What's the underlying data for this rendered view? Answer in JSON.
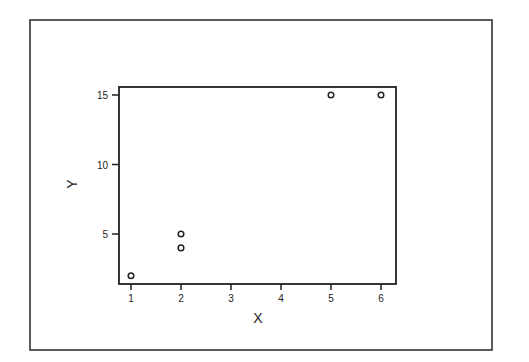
{
  "chart_data": {
    "type": "scatter",
    "title": "",
    "xlabel": "X",
    "ylabel": "Y",
    "xlim": [
      0.75,
      6.3
    ],
    "ylim": [
      1.3,
      15.6
    ],
    "xticks": [
      1,
      2,
      3,
      4,
      5,
      6
    ],
    "yticks": [
      5,
      10,
      15
    ],
    "grid": false,
    "legend": null,
    "marker": "open-circle",
    "series": [
      {
        "name": "data",
        "points": [
          {
            "x": 1,
            "y": 2
          },
          {
            "x": 2,
            "y": 5
          },
          {
            "x": 2,
            "y": 4
          },
          {
            "x": 5,
            "y": 15
          },
          {
            "x": 6,
            "y": 15
          }
        ]
      }
    ]
  },
  "colors": {
    "ink": "#222222",
    "background": "#ffffff"
  }
}
